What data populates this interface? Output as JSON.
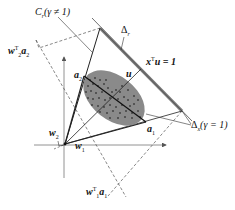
{
  "labels": {
    "cone_c": "C",
    "cone_c_sub": "r",
    "cone_c_cond": "(γ ≠ 1)",
    "delta_r": "Δ",
    "delta_r_sub": "r",
    "hyperplane": "x",
    "hyperplane_sup": "T",
    "hyperplane_rest": "u = 1",
    "u": "u",
    "a1": "a",
    "a1_sub": "1",
    "a2": "a",
    "a2_sub": "2",
    "w1": "w",
    "w1_sub": "1",
    "w2": "w",
    "w2_sub": "2",
    "w1a1_w": "w",
    "w1a1_sub": "1",
    "w1a1_sup": "T",
    "w1a1_a": "a",
    "w1a1_asub": "1",
    "w2a2_w": "w",
    "w2a2_sub": "2",
    "w2a2_sup": "T",
    "w2a2_a": "a",
    "w2a2_asub": "2",
    "delta_x": "Δ",
    "delta_x_sub": "x",
    "delta_x_cond": "(γ = 1)"
  },
  "colors": {
    "ellipse_fill": "#8a8a8a",
    "thick_band": "#7a7a7a",
    "line": "#222222",
    "axis": "#666666",
    "dashed": "#555555"
  }
}
